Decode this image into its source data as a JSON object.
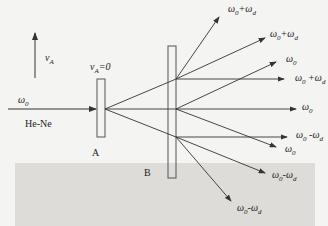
{
  "diagram": {
    "velocity_label": "v",
    "velocity_sub": "A",
    "velocity_zero_label": "v",
    "velocity_zero_sub": "A",
    "velocity_zero_suffix": "=0",
    "input_beam_label": "ω",
    "input_beam_sub": "0",
    "source_label": "He-Ne",
    "plate_a_label": "A",
    "plate_b_label": "B",
    "output_labels": [
      {
        "id": "r1",
        "base": "ω",
        "base_sub": "0",
        "op": "+",
        "shift": "ω",
        "shift_sub": "d"
      },
      {
        "id": "r2",
        "base": "ω",
        "base_sub": "0",
        "op": "+",
        "shift": "ω",
        "shift_sub": "d"
      },
      {
        "id": "r3",
        "base": "ω",
        "base_sub": "0",
        "op": "",
        "shift": "",
        "shift_sub": ""
      },
      {
        "id": "r4",
        "base": "ω",
        "base_sub": "0",
        "op": " +",
        "shift": "ω",
        "shift_sub": "d"
      },
      {
        "id": "r5",
        "base": "ω",
        "base_sub": "0",
        "op": "",
        "shift": "",
        "shift_sub": ""
      },
      {
        "id": "r6",
        "base": "ω",
        "base_sub": "0",
        "op": " -",
        "shift": "ω",
        "shift_sub": "d"
      },
      {
        "id": "r7",
        "base": "ω",
        "base_sub": "0",
        "op": "",
        "shift": "",
        "shift_sub": ""
      },
      {
        "id": "r8",
        "base": "ω",
        "base_sub": "0",
        "op": "-",
        "shift": "ω",
        "shift_sub": "d"
      },
      {
        "id": "r9",
        "base": "ω",
        "base_sub": "0",
        "op": "-",
        "shift": "ω",
        "shift_sub": "d"
      }
    ],
    "colors": {
      "line": "#333333",
      "plate": "#555555",
      "background": "#f4f4f2",
      "band": "#dedcd8"
    }
  }
}
